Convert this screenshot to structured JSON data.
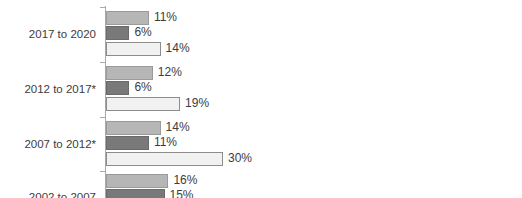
{
  "chart_data": {
    "type": "bar",
    "orientation": "horizontal",
    "title": "",
    "subtitle": "",
    "xlabel": "",
    "ylabel": "",
    "grid": false,
    "legend": "none",
    "value_suffix": "%",
    "xlim": [
      0,
      32
    ],
    "px_per_unit": 3.9,
    "categories": [
      "2017 to 2020",
      "2012 to 2017*",
      "2007 to 2012*",
      "2002 to 2007"
    ],
    "series": [
      {
        "name": "series-1",
        "color": "#b6b6b6",
        "values": [
          11,
          12,
          14,
          16
        ]
      },
      {
        "name": "series-2",
        "color": "#797979",
        "values": [
          6,
          6,
          11,
          15
        ]
      },
      {
        "name": "series-3",
        "color": "#f1f1f1",
        "values": [
          14,
          19,
          30,
          null
        ]
      }
    ],
    "groups": [
      {
        "label": "2017 to 2020",
        "bars": [
          {
            "series": 0,
            "value": 11,
            "label": "11%"
          },
          {
            "series": 1,
            "value": 6,
            "label": "6%"
          },
          {
            "series": 2,
            "value": 14,
            "label": "14%"
          }
        ]
      },
      {
        "label": "2012 to 2017*",
        "bars": [
          {
            "series": 0,
            "value": 12,
            "label": "12%"
          },
          {
            "series": 1,
            "value": 6,
            "label": "6%"
          },
          {
            "series": 2,
            "value": 19,
            "label": "19%"
          }
        ]
      },
      {
        "label": "2007 to 2012*",
        "bars": [
          {
            "series": 0,
            "value": 14,
            "label": "14%"
          },
          {
            "series": 1,
            "value": 11,
            "label": "11%"
          },
          {
            "series": 2,
            "value": 30,
            "label": "30%"
          }
        ]
      },
      {
        "label": "2002 to 2007",
        "bars": [
          {
            "series": 0,
            "value": 16,
            "label": "16%"
          },
          {
            "series": 1,
            "value": 15,
            "label": "15%"
          }
        ]
      }
    ]
  }
}
